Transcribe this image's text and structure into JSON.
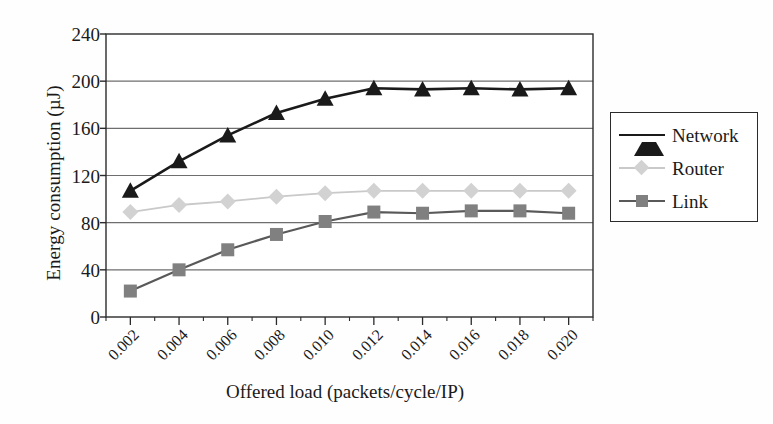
{
  "chart_data": {
    "type": "line",
    "title": "",
    "xlabel": "Offered load (packets/cycle/IP)",
    "ylabel": "Energy consumption (µJ)",
    "categories": [
      "0.002",
      "0.004",
      "0.006",
      "0.008",
      "0.010",
      "0.012",
      "0.014",
      "0.016",
      "0.018",
      "0.020"
    ],
    "x": [
      0.002,
      0.004,
      0.006,
      0.008,
      0.01,
      0.012,
      0.014,
      0.016,
      0.018,
      0.02
    ],
    "series": [
      {
        "name": "Network",
        "marker": "triangle",
        "color": "#1a1a1a",
        "line_color": "#1a1a1a",
        "values": [
          107,
          132,
          154,
          173,
          185,
          194,
          193,
          194,
          193,
          194
        ]
      },
      {
        "name": "Router",
        "marker": "diamond",
        "color": "#d2d2d2",
        "line_color": "#c9c9c9",
        "values": [
          89,
          95,
          98,
          102,
          105,
          107,
          107,
          107,
          107,
          107
        ]
      },
      {
        "name": "Link",
        "marker": "square",
        "color": "#808080",
        "line_color": "#595959",
        "values": [
          22,
          40,
          57,
          70,
          81,
          89,
          88,
          90,
          90,
          88
        ]
      }
    ],
    "ylim": [
      0,
      240
    ],
    "yticks": [
      0,
      40,
      80,
      120,
      160,
      200,
      240
    ],
    "ytick_labels": [
      "0",
      "40",
      "80",
      "120",
      "160",
      "200",
      "240"
    ],
    "grid": true,
    "grid_axis": "y",
    "grid_color": "#6e6e6e",
    "legend_position": "right",
    "legend_entries": [
      "Network",
      "Router",
      "Link"
    ],
    "axis_color": "#2b2b2b",
    "background": "#ffffff"
  }
}
